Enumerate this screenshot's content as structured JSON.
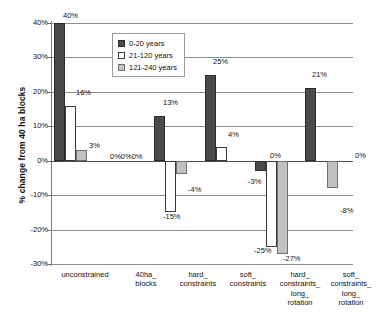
{
  "chart_data": {
    "type": "bar",
    "title": "",
    "xlabel": "",
    "ylabel": "% change from 40 ha blocks",
    "ylim": [
      -30,
      40
    ],
    "ytick_labels": [
      "40%",
      "30%",
      "20%",
      "10%",
      "0%",
      "-10%",
      "-20%",
      "-30%"
    ],
    "ytick_values": [
      40,
      30,
      20,
      10,
      0,
      -10,
      -20,
      -30
    ],
    "grid": true,
    "legend_position": "top-center",
    "categories": [
      "unconstrained",
      "40ha_ blocks",
      "hard_ constraints",
      "soft_ constraints",
      "hard_ constraints_ long_ rotation",
      "soft_ constraints_ long_ rotation"
    ],
    "category_lines": [
      [
        "unconstrained"
      ],
      [
        "40ha_",
        "blocks"
      ],
      [
        "hard_",
        "constraints"
      ],
      [
        "soft_",
        "constraints"
      ],
      [
        "hard_",
        "constraints_",
        "long_",
        "rotation"
      ],
      [
        "soft_",
        "constraints_",
        "long_",
        "rotation"
      ]
    ],
    "series": [
      {
        "name": "0-20 years",
        "color": "#4a4a4a",
        "values": [
          40,
          0,
          13,
          25,
          -3,
          21
        ],
        "labels": [
          "40%",
          "0%",
          "13%",
          "25%",
          "-3%",
          "21%"
        ]
      },
      {
        "name": "21-120 years",
        "color": "#ffffff",
        "values": [
          16,
          0,
          -15,
          4,
          -25,
          0
        ],
        "labels": [
          "16%",
          "0%",
          "-15%",
          "4%",
          "-25%",
          "0%"
        ]
      },
      {
        "name": "121-240 years",
        "color": "#c2c2c2",
        "values": [
          3,
          0,
          -4,
          0,
          -27,
          -8
        ],
        "labels": [
          "3%",
          "0%",
          "-4%",
          "0%",
          "-27%",
          "-8%"
        ]
      }
    ],
    "zero_group_label": "0%0%0%"
  },
  "legend": {
    "items": [
      {
        "label": "0-20 years"
      },
      {
        "label": "21-120 years"
      },
      {
        "label": "121-240 years"
      }
    ]
  }
}
